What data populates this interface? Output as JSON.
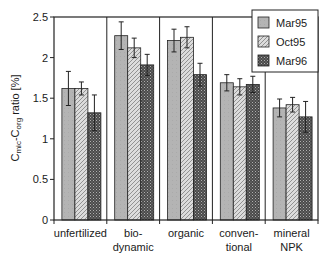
{
  "chart_data": {
    "type": "bar",
    "title": "",
    "xlabel": "",
    "ylabel": "Cmic-Corg ratio [%]",
    "ylabel_parts": {
      "c1": "C",
      "s1": "mic",
      "dash": "-",
      "c2": "C",
      "s2": "org",
      "rest": " ratio [%]"
    },
    "ylim": [
      0,
      2.5
    ],
    "yticks": [
      0,
      0.5,
      1,
      1.5,
      2,
      2.5
    ],
    "ytick_labels": [
      "0",
      "0.5",
      "1",
      "1.5",
      "2",
      "2.5"
    ],
    "grid": false,
    "legend_position": "top-right (inside)",
    "categories": [
      "unfertilized",
      "bio-dynamic",
      "organic",
      "conven-tional",
      "mineral NPK"
    ],
    "category_label_lines": [
      [
        "unfertilized"
      ],
      [
        "bio-",
        "dynamic"
      ],
      [
        "organic"
      ],
      [
        "conven-",
        "tional"
      ],
      [
        "mineral",
        "NPK"
      ]
    ],
    "series": [
      {
        "name": "Mar95",
        "pattern": "solid-gray",
        "values": [
          1.62,
          2.27,
          2.21,
          1.69,
          1.38
        ],
        "errors": [
          0.21,
          0.17,
          0.14,
          0.1,
          0.11
        ]
      },
      {
        "name": "Oct95",
        "pattern": "diagonal-hatch",
        "values": [
          1.62,
          2.12,
          2.25,
          1.64,
          1.42
        ],
        "errors": [
          0.08,
          0.12,
          0.13,
          0.1,
          0.09
        ]
      },
      {
        "name": "Mar96",
        "pattern": "dark-checker",
        "values": [
          1.32,
          1.91,
          1.79,
          1.67,
          1.27
        ],
        "errors": [
          0.22,
          0.13,
          0.14,
          0.1,
          0.19
        ]
      }
    ]
  },
  "colors": {
    "mar95_fill": "#b4b4b4",
    "oct95_fill": "#d8d8d8",
    "oct95_hatch": "#8a8a8a",
    "mar96_fill": "#5a5a5a",
    "mar96_dots": "#a8a8a8",
    "axis": "#222222"
  }
}
